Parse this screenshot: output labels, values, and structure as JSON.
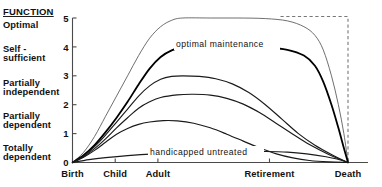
{
  "figure": {
    "axis_heading": "FUNCTION",
    "function_levels": [
      {
        "label": "Optimal",
        "lines": [
          "Optimal"
        ],
        "value": 5
      },
      {
        "label": "Self-sufficient",
        "lines": [
          "Self -",
          "sufficient"
        ],
        "value": 4
      },
      {
        "label": "Partially independent",
        "lines": [
          "Partially",
          "independent"
        ],
        "value": 3
      },
      {
        "label": "Partially dependent",
        "lines": [
          "Partially",
          "dependent"
        ],
        "value": 2
      },
      {
        "label": "Totally dependent",
        "lines": [
          "Totally",
          "dependent"
        ],
        "value": 1
      }
    ],
    "annotations": [
      {
        "name": "optimal-maintenance",
        "text": "optimal maintenance"
      },
      {
        "name": "handicapped-untreated",
        "text": "handicapped  untreated"
      }
    ]
  },
  "chart_data": {
    "type": "line",
    "title": "",
    "xlabel": "",
    "ylabel": "FUNCTION",
    "xlim": [
      0,
      100
    ],
    "ylim": [
      0,
      5
    ],
    "grid": false,
    "legend": "none",
    "x_tick_labels": [
      "Birth",
      "Child",
      "Adult",
      "Retirement",
      "Death"
    ],
    "x_tick_positions": [
      0,
      15.5,
      31,
      71.5,
      100
    ],
    "y_tick_labels": [
      "0",
      "1",
      "2",
      "3",
      "4",
      "5"
    ],
    "y_tick_values": [
      0,
      1,
      2,
      3,
      4,
      5
    ],
    "annotation_optimal": "optimal maintenance",
    "annotation_handicapped": "handicapped  untreated",
    "series": [
      {
        "name": "optimal",
        "style": "thin",
        "peak": 5.0,
        "points": [
          [
            0,
            0
          ],
          [
            4,
            0.35
          ],
          [
            8,
            0.9
          ],
          [
            12,
            1.6
          ],
          [
            16,
            2.3
          ],
          [
            20,
            3.0
          ],
          [
            24,
            3.7
          ],
          [
            28,
            4.3
          ],
          [
            32,
            4.7
          ],
          [
            36,
            4.92
          ],
          [
            40,
            5.0
          ],
          [
            50,
            5.0
          ],
          [
            60,
            5.0
          ],
          [
            70,
            4.98
          ],
          [
            78,
            4.9
          ],
          [
            84,
            4.7
          ],
          [
            88,
            4.4
          ],
          [
            91,
            3.9
          ],
          [
            94,
            3.0
          ],
          [
            96.5,
            2.0
          ],
          [
            98.5,
            1.0
          ],
          [
            100,
            0
          ]
        ]
      },
      {
        "name": "optimal-maintenance",
        "style": "bold",
        "peak": 4.0,
        "points": [
          [
            0,
            0
          ],
          [
            4,
            0.25
          ],
          [
            8,
            0.6
          ],
          [
            12,
            1.05
          ],
          [
            16,
            1.55
          ],
          [
            20,
            2.1
          ],
          [
            24,
            2.7
          ],
          [
            28,
            3.25
          ],
          [
            32,
            3.65
          ],
          [
            36,
            3.88
          ],
          [
            40,
            3.98
          ],
          [
            50,
            4.0
          ],
          [
            60,
            4.0
          ],
          [
            70,
            3.98
          ],
          [
            78,
            3.9
          ],
          [
            84,
            3.7
          ],
          [
            88,
            3.35
          ],
          [
            91,
            2.8
          ],
          [
            94,
            2.0
          ],
          [
            96.5,
            1.2
          ],
          [
            98.5,
            0.5
          ],
          [
            100,
            0
          ]
        ]
      },
      {
        "name": "partially-independent",
        "style": "med",
        "peak": 3.0,
        "points": [
          [
            0,
            0
          ],
          [
            4,
            0.22
          ],
          [
            8,
            0.55
          ],
          [
            12,
            0.95
          ],
          [
            16,
            1.4
          ],
          [
            20,
            1.85
          ],
          [
            24,
            2.3
          ],
          [
            28,
            2.65
          ],
          [
            32,
            2.88
          ],
          [
            36,
            2.98
          ],
          [
            40,
            3.0
          ],
          [
            46,
            2.98
          ],
          [
            52,
            2.9
          ],
          [
            58,
            2.72
          ],
          [
            64,
            2.42
          ],
          [
            70,
            2.0
          ],
          [
            76,
            1.5
          ],
          [
            82,
            1.0
          ],
          [
            88,
            0.6
          ],
          [
            94,
            0.28
          ],
          [
            100,
            0
          ]
        ]
      },
      {
        "name": "partially-dependent",
        "style": "med",
        "peak": 2.35,
        "points": [
          [
            0,
            0
          ],
          [
            4,
            0.2
          ],
          [
            8,
            0.48
          ],
          [
            12,
            0.82
          ],
          [
            16,
            1.2
          ],
          [
            20,
            1.55
          ],
          [
            24,
            1.88
          ],
          [
            28,
            2.1
          ],
          [
            32,
            2.25
          ],
          [
            38,
            2.34
          ],
          [
            44,
            2.36
          ],
          [
            50,
            2.33
          ],
          [
            56,
            2.22
          ],
          [
            62,
            2.02
          ],
          [
            68,
            1.72
          ],
          [
            74,
            1.35
          ],
          [
            80,
            0.98
          ],
          [
            86,
            0.62
          ],
          [
            93,
            0.28
          ],
          [
            100,
            0
          ]
        ]
      },
      {
        "name": "totally-dependent",
        "style": "med",
        "peak": 1.45,
        "points": [
          [
            0,
            0
          ],
          [
            4,
            0.18
          ],
          [
            8,
            0.42
          ],
          [
            12,
            0.7
          ],
          [
            16,
            0.98
          ],
          [
            20,
            1.18
          ],
          [
            24,
            1.32
          ],
          [
            28,
            1.4
          ],
          [
            33,
            1.45
          ],
          [
            38,
            1.44
          ],
          [
            44,
            1.36
          ],
          [
            50,
            1.2
          ],
          [
            56,
            0.98
          ],
          [
            62,
            0.74
          ],
          [
            68,
            0.5
          ],
          [
            74,
            0.3
          ],
          [
            80,
            0.16
          ],
          [
            86,
            0.07
          ],
          [
            93,
            0.02
          ],
          [
            100,
            0
          ]
        ]
      },
      {
        "name": "handicapped-untreated",
        "style": "med",
        "peak": 0.38,
        "points": [
          [
            0,
            0
          ],
          [
            6,
            0.1
          ],
          [
            12,
            0.17
          ],
          [
            20,
            0.24
          ],
          [
            30,
            0.3
          ],
          [
            40,
            0.34
          ],
          [
            50,
            0.37
          ],
          [
            60,
            0.38
          ],
          [
            70,
            0.38
          ],
          [
            78,
            0.36
          ],
          [
            85,
            0.3
          ],
          [
            92,
            0.2
          ],
          [
            96,
            0.12
          ],
          [
            100,
            0
          ]
        ]
      }
    ],
    "dashed_guide": {
      "name": "potential-lifespan-guide",
      "points": [
        [
          75.5,
          5.05
        ],
        [
          100,
          5.05
        ],
        [
          100,
          0
        ]
      ]
    }
  }
}
